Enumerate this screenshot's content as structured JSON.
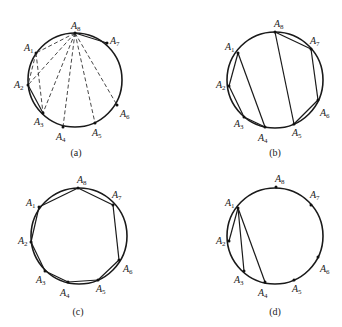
{
  "figure": {
    "panels": [
      {
        "id": "a",
        "caption": "(a)",
        "center": [
          75,
          80
        ],
        "radius": 47,
        "points": {
          "A1": [
            36,
            53
          ],
          "A2": [
            28,
            85
          ],
          "A3": [
            43,
            113
          ],
          "A4": [
            63,
            127
          ],
          "A5": [
            95,
            123
          ],
          "A6": [
            117,
            105
          ],
          "A7": [
            107,
            43
          ],
          "A8": [
            75,
            33
          ]
        },
        "labels": [
          {
            "name": "A",
            "sub": "8",
            "x": 71,
            "y": 29
          },
          {
            "name": "A",
            "sub": "7",
            "x": 110,
            "y": 44
          },
          {
            "name": "A",
            "sub": "1",
            "x": 24,
            "y": 51
          },
          {
            "name": "A",
            "sub": "2",
            "x": 14,
            "y": 88
          },
          {
            "name": "A",
            "sub": "3",
            "x": 34,
            "y": 125
          },
          {
            "name": "A",
            "sub": "4",
            "x": 56,
            "y": 140
          },
          {
            "name": "A",
            "sub": "5",
            "x": 92,
            "y": 136
          },
          {
            "name": "A",
            "sub": "6",
            "x": 120,
            "y": 117
          }
        ],
        "solid_segments": [
          [
            "A8",
            "A7"
          ],
          [
            "A2",
            "A3"
          ]
        ],
        "dashed_segments": [
          [
            "A8",
            "A1"
          ],
          [
            "A8",
            "A2"
          ],
          [
            "A8",
            "A3"
          ],
          [
            "A8",
            "A4"
          ],
          [
            "A8",
            "A5"
          ],
          [
            "A8",
            "A6"
          ],
          [
            "A1",
            "A2"
          ],
          [
            "A1",
            "A3"
          ]
        ]
      },
      {
        "id": "b",
        "caption": "(b)",
        "center": [
          275,
          80
        ],
        "radius": 48,
        "points": {
          "A1": [
            238,
            53
          ],
          "A2": [
            229,
            86
          ],
          "A3": [
            244,
            117
          ],
          "A4": [
            265,
            127
          ],
          "A5": [
            294,
            124
          ],
          "A6": [
            318,
            100
          ],
          "A7": [
            311,
            49
          ],
          "A8": [
            275,
            32
          ]
        },
        "labels": [
          {
            "name": "A",
            "sub": "8",
            "x": 274,
            "y": 27
          },
          {
            "name": "A",
            "sub": "7",
            "x": 310,
            "y": 44
          },
          {
            "name": "A",
            "sub": "1",
            "x": 225,
            "y": 50
          },
          {
            "name": "A",
            "sub": "2",
            "x": 216,
            "y": 88
          },
          {
            "name": "A",
            "sub": "3",
            "x": 234,
            "y": 127
          },
          {
            "name": "A",
            "sub": "4",
            "x": 258,
            "y": 141
          },
          {
            "name": "A",
            "sub": "5",
            "x": 292,
            "y": 136
          },
          {
            "name": "A",
            "sub": "6",
            "x": 320,
            "y": 116
          }
        ],
        "solid_segments": [
          [
            "A1",
            "A2"
          ],
          [
            "A2",
            "A3"
          ],
          [
            "A3",
            "A4"
          ],
          [
            "A1",
            "A4"
          ],
          [
            "A8",
            "A5"
          ],
          [
            "A8",
            "A7"
          ],
          [
            "A7",
            "A6"
          ],
          [
            "A6",
            "A5"
          ]
        ],
        "dashed_segments": []
      },
      {
        "id": "c",
        "caption": "(c)",
        "center": [
          79,
          236
        ],
        "radius": 48,
        "points": {
          "A1": [
            39,
            207
          ],
          "A2": [
            31,
            242
          ],
          "A3": [
            45,
            271
          ],
          "A4": [
            68,
            282
          ],
          "A5": [
            98,
            280
          ],
          "A6": [
            119,
            260
          ],
          "A7": [
            113,
            205
          ],
          "A8": [
            78,
            188
          ]
        },
        "labels": [
          {
            "name": "A",
            "sub": "8",
            "x": 77,
            "y": 183
          },
          {
            "name": "A",
            "sub": "7",
            "x": 112,
            "y": 198
          },
          {
            "name": "A",
            "sub": "1",
            "x": 26,
            "y": 206
          },
          {
            "name": "A",
            "sub": "2",
            "x": 18,
            "y": 244
          },
          {
            "name": "A",
            "sub": "3",
            "x": 36,
            "y": 283
          },
          {
            "name": "A",
            "sub": "4",
            "x": 60,
            "y": 296
          },
          {
            "name": "A",
            "sub": "5",
            "x": 96,
            "y": 292
          },
          {
            "name": "A",
            "sub": "6",
            "x": 123,
            "y": 272
          }
        ],
        "solid_segments": [
          [
            "A1",
            "A2"
          ],
          [
            "A2",
            "A3"
          ],
          [
            "A3",
            "A4"
          ],
          [
            "A4",
            "A5"
          ],
          [
            "A5",
            "A6"
          ],
          [
            "A6",
            "A7"
          ],
          [
            "A7",
            "A8"
          ],
          [
            "A8",
            "A1"
          ]
        ],
        "dashed_segments": []
      },
      {
        "id": "d",
        "caption": "(d)",
        "center": [
          275,
          236
        ],
        "radius": 48,
        "points": {
          "A1": [
            238,
            208
          ],
          "A2": [
            229,
            241
          ],
          "A3": [
            244,
            271
          ],
          "A4": [
            265,
            282
          ],
          "A5": [
            294,
            280
          ],
          "A6": [
            318,
            257
          ],
          "A7": [
            311,
            205
          ],
          "A8": [
            276,
            187
          ]
        },
        "labels": [
          {
            "name": "A",
            "sub": "8",
            "x": 275,
            "y": 182
          },
          {
            "name": "A",
            "sub": "7",
            "x": 310,
            "y": 198
          },
          {
            "name": "A",
            "sub": "1",
            "x": 225,
            "y": 206
          },
          {
            "name": "A",
            "sub": "2",
            "x": 216,
            "y": 244
          },
          {
            "name": "A",
            "sub": "3",
            "x": 234,
            "y": 283
          },
          {
            "name": "A",
            "sub": "4",
            "x": 258,
            "y": 296
          },
          {
            "name": "A",
            "sub": "5",
            "x": 292,
            "y": 292
          },
          {
            "name": "A",
            "sub": "6",
            "x": 320,
            "y": 272
          }
        ],
        "solid_segments": [
          [
            "A1",
            "A2"
          ],
          [
            "A1",
            "A3"
          ],
          [
            "A1",
            "A4"
          ]
        ],
        "dashed_segments": []
      }
    ],
    "captions_pos": {
      "a": [
        76,
        156
      ],
      "b": [
        275,
        156
      ],
      "c": [
        78,
        315
      ],
      "d": [
        275,
        315
      ]
    }
  }
}
